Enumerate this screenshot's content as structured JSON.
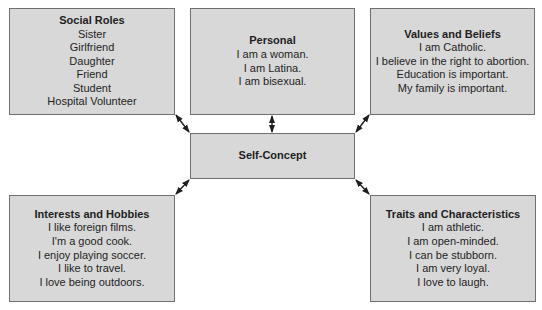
{
  "diagram": {
    "center": {
      "title": "Self-Concept"
    },
    "boxes": {
      "social_roles": {
        "title": "Social Roles",
        "items": [
          "Sister",
          "Girlfriend",
          "Daughter",
          "Friend",
          "Student",
          "Hospital Volunteer"
        ]
      },
      "personal": {
        "title": "Personal",
        "items": [
          "I am a woman.",
          "I am Latina.",
          "I am bisexual."
        ]
      },
      "values_beliefs": {
        "title": "Values and Beliefs",
        "items": [
          "I am Catholic.",
          "I believe in the right to abortion.",
          "Education is important.",
          "My family is important."
        ]
      },
      "interests_hobbies": {
        "title": "Interests and Hobbies",
        "items": [
          "I like foreign films.",
          "I'm a good cook.",
          "I enjoy playing soccer.",
          "I like to travel.",
          "I love being outdoors."
        ]
      },
      "traits_characteristics": {
        "title": "Traits and Characteristics",
        "items": [
          "I am athletic.",
          "I am open-minded.",
          "I can be stubborn.",
          "I am very loyal.",
          "I love to laugh."
        ]
      }
    },
    "colors": {
      "box_fill": "#d8d8d8",
      "box_border": "#6f6f6f",
      "arrow": "#1e1e1e"
    }
  }
}
